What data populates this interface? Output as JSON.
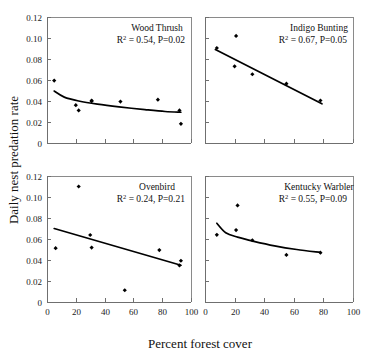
{
  "figure": {
    "ylabel": "Daily nest predation rate",
    "xlabel": "Percent forest cover",
    "y_ticks": [
      "0.12",
      "0.10",
      "0.08",
      "0.06",
      "0.04",
      "0.02",
      "0"
    ],
    "y_tick_values": [
      0.12,
      0.1,
      0.08,
      0.06,
      0.04,
      0.02,
      0
    ],
    "x_ticks": [
      "0",
      "20",
      "40",
      "60",
      "80",
      "100"
    ],
    "x_tick_values": [
      0,
      20,
      40,
      60,
      80,
      100
    ]
  },
  "chart_data": {
    "type": "scatter",
    "title": "",
    "xlabel": "Percent forest cover",
    "ylabel": "Daily nest predation rate",
    "xlim": [
      0,
      100
    ],
    "ylim": [
      0,
      0.12
    ],
    "grid": false,
    "legend": "none",
    "layout": "2x2 panel grid of scatter plots with fitted regression lines",
    "panels": [
      {
        "id": "wood-thrush",
        "position": "top-left",
        "title": "Wood Thrush",
        "r_squared_label": "R",
        "r_squared_sup": "2",
        "stats": "= 0.54,  P=0.02",
        "r_squared": 0.54,
        "p_value": 0.02,
        "x_axis_labeled": false,
        "y_axis_labeled": true,
        "points": [
          {
            "x": 5,
            "y": 0.0595
          },
          {
            "x": 20,
            "y": 0.036
          },
          {
            "x": 22,
            "y": 0.031
          },
          {
            "x": 31,
            "y": 0.0405
          },
          {
            "x": 31,
            "y": 0.0398
          },
          {
            "x": 51,
            "y": 0.0395
          },
          {
            "x": 77,
            "y": 0.0413
          },
          {
            "x": 92,
            "y": 0.031
          },
          {
            "x": 93,
            "y": 0.0183
          }
        ],
        "fit": {
          "type": "decreasing-curve",
          "points": [
            {
              "x": 5,
              "y": 0.0495
            },
            {
              "x": 12,
              "y": 0.0437
            },
            {
              "x": 22,
              "y": 0.04
            },
            {
              "x": 35,
              "y": 0.037
            },
            {
              "x": 50,
              "y": 0.0344
            },
            {
              "x": 68,
              "y": 0.0318
            },
            {
              "x": 82,
              "y": 0.03
            },
            {
              "x": 93,
              "y": 0.0293
            }
          ]
        }
      },
      {
        "id": "indigo-bunting",
        "position": "top-right",
        "title": "Indigo Bunting",
        "r_squared_label": "R",
        "r_squared_sup": "2",
        "stats": "= 0.67,  P=0.05",
        "r_squared": 0.67,
        "p_value": 0.05,
        "x_axis_labeled": false,
        "y_axis_labeled": false,
        "points": [
          {
            "x": 8,
            "y": 0.0905
          },
          {
            "x": 21,
            "y": 0.102
          },
          {
            "x": 20,
            "y": 0.073
          },
          {
            "x": 32,
            "y": 0.0655
          },
          {
            "x": 55,
            "y": 0.0565
          },
          {
            "x": 78,
            "y": 0.0405
          }
        ],
        "fit": {
          "type": "line",
          "points": [
            {
              "x": 7,
              "y": 0.089
            },
            {
              "x": 79,
              "y": 0.0373
            }
          ]
        }
      },
      {
        "id": "ovenbird",
        "position": "bottom-left",
        "title": "Ovenbird",
        "r_squared_label": "R",
        "r_squared_sup": "2",
        "stats": "= 0.24,  P=0.21",
        "r_squared": 0.24,
        "p_value": 0.21,
        "x_axis_labeled": true,
        "y_axis_labeled": true,
        "points": [
          {
            "x": 22,
            "y": 0.11
          },
          {
            "x": 6,
            "y": 0.0513
          },
          {
            "x": 30,
            "y": 0.0638
          },
          {
            "x": 31,
            "y": 0.0518
          },
          {
            "x": 54,
            "y": 0.0112
          },
          {
            "x": 78,
            "y": 0.0495
          },
          {
            "x": 93,
            "y": 0.0393
          },
          {
            "x": 92,
            "y": 0.0348
          }
        ],
        "fit": {
          "type": "line",
          "points": [
            {
              "x": 5,
              "y": 0.07
            },
            {
              "x": 93,
              "y": 0.035
            }
          ]
        }
      },
      {
        "id": "kentucky-warbler",
        "position": "bottom-right",
        "title": "Kentucky Warbler",
        "r_squared_label": "R",
        "r_squared_sup": "2",
        "stats": "= 0.55,  P=0.09",
        "r_squared": 0.55,
        "p_value": 0.09,
        "x_axis_labeled": true,
        "y_axis_labeled": false,
        "points": [
          {
            "x": 22,
            "y": 0.092
          },
          {
            "x": 8,
            "y": 0.064
          },
          {
            "x": 21,
            "y": 0.0685
          },
          {
            "x": 32,
            "y": 0.0588
          },
          {
            "x": 55,
            "y": 0.0448
          },
          {
            "x": 78,
            "y": 0.047
          }
        ],
        "fit": {
          "type": "decreasing-curve",
          "points": [
            {
              "x": 8,
              "y": 0.075
            },
            {
              "x": 14,
              "y": 0.066
            },
            {
              "x": 22,
              "y": 0.0618
            },
            {
              "x": 33,
              "y": 0.0578
            },
            {
              "x": 47,
              "y": 0.0535
            },
            {
              "x": 62,
              "y": 0.05
            },
            {
              "x": 78,
              "y": 0.0472
            }
          ]
        }
      }
    ]
  }
}
